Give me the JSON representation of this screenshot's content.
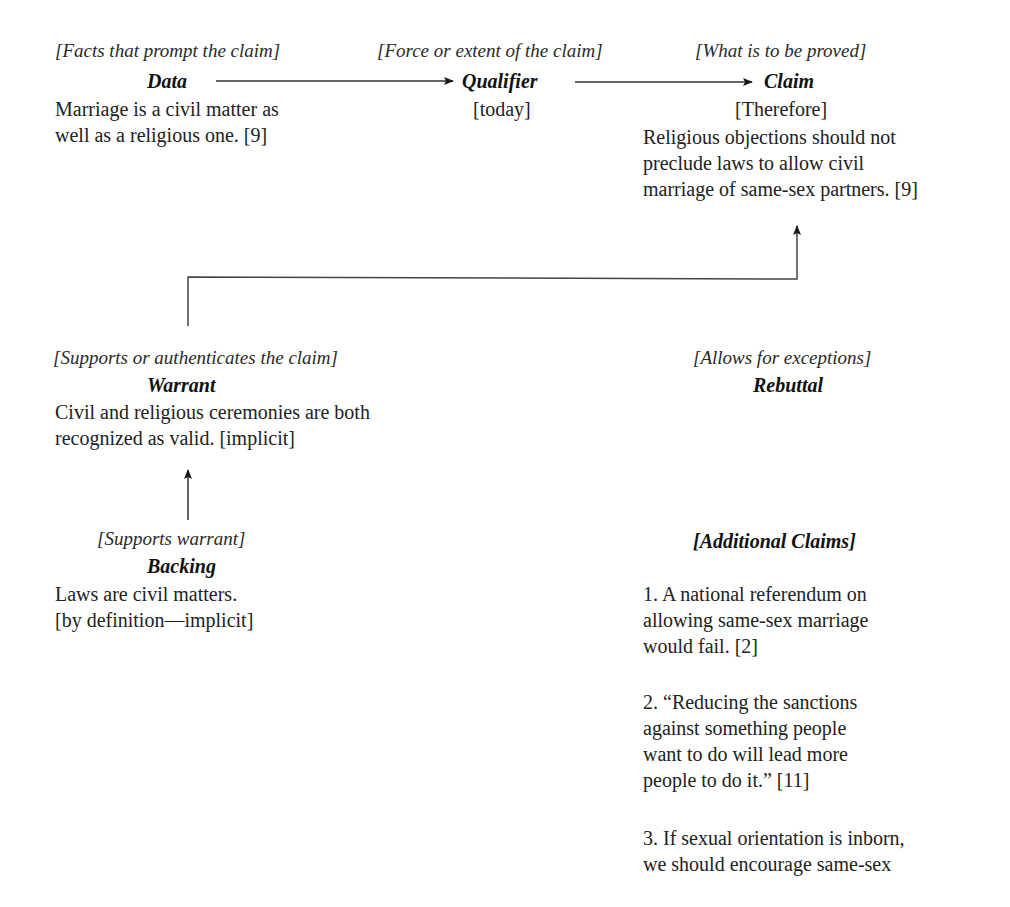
{
  "diagram": {
    "type": "toulmin-argument-model",
    "data": {
      "label": "[Facts that prompt the claim]",
      "title": "Data",
      "text_lines": [
        "Marriage is a civil matter as",
        "well as a religious one. [9]"
      ]
    },
    "qualifier": {
      "label": "[Force or extent of the claim]",
      "title": "Qualifier",
      "text": "[today]"
    },
    "claim": {
      "label": "[What is to be proved]",
      "title": "Claim",
      "connector": "[Therefore]",
      "text_lines": [
        "Religious objections should not",
        "preclude laws to allow civil",
        "marriage of same-sex partners. [9]"
      ]
    },
    "warrant": {
      "label": "[Supports or authenticates the claim]",
      "title": "Warrant",
      "text_lines": [
        "Civil and religious ceremonies are both",
        "recognized as valid. [implicit]"
      ]
    },
    "rebuttal": {
      "label": "[Allows for exceptions]",
      "title": "Rebuttal"
    },
    "backing": {
      "label": "[Supports warrant]",
      "title": "Backing",
      "text_lines": [
        "Laws are civil matters.",
        "[by definition—implicit]"
      ]
    },
    "additional_claims": {
      "title": "[Additional Claims]",
      "items": [
        {
          "lines": [
            "1. A national referendum on",
            "allowing same-sex marriage",
            "would fail. [2]"
          ]
        },
        {
          "lines": [
            "2. “Reducing the sanctions",
            "against something people",
            "want to do will lead more",
            "people to do it.” [11]"
          ]
        },
        {
          "lines": [
            "3. If sexual orientation is inborn,",
            "we should encourage same-sex"
          ]
        }
      ]
    },
    "arrows": [
      {
        "from": "data",
        "to": "qualifier"
      },
      {
        "from": "qualifier",
        "to": "claim"
      },
      {
        "from": "warrant",
        "to": "claim"
      },
      {
        "from": "backing",
        "to": "warrant"
      }
    ],
    "colors": {
      "text": "#222222",
      "lines": "#333333",
      "background": "#ffffff"
    }
  }
}
